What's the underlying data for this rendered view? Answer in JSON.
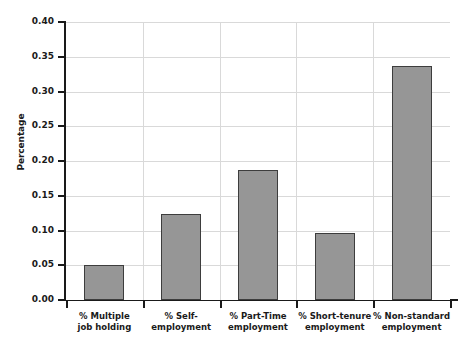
{
  "chart_data": {
    "type": "bar",
    "title": "",
    "subtitle": "",
    "xlabel": "",
    "ylabel": "Percentage",
    "ylim": [
      0.0,
      0.4
    ],
    "ytick_labels": [
      "0.00",
      "0.05",
      "0.10",
      "0.15",
      "0.20",
      "0.25",
      "0.30",
      "0.35",
      "0.40"
    ],
    "ytick_values": [
      0.0,
      0.05,
      0.1,
      0.15,
      0.2,
      0.25,
      0.3,
      0.35,
      0.4
    ],
    "grid": "both",
    "legend": "none",
    "categories": [
      "% Multiple job holding",
      "% Self-employment",
      "% Part-Time employment",
      "% Short-tenure employment",
      "% Non-standard employment"
    ],
    "category_lines": [
      [
        "% Multiple",
        "job holding"
      ],
      [
        "% Self-",
        "employment"
      ],
      [
        "% Part-Time",
        "employment"
      ],
      [
        "% Short-tenure",
        "employment"
      ],
      [
        "% Non-standard",
        "employment"
      ]
    ],
    "values": [
      0.051,
      0.124,
      0.187,
      0.097,
      0.337
    ],
    "bar_color": "#969696",
    "bar_edge_color": "#3d3d3d",
    "axis_color": "#1a1a1a",
    "grid_color": "#d9d9d9",
    "background_color": "#ffffff"
  }
}
